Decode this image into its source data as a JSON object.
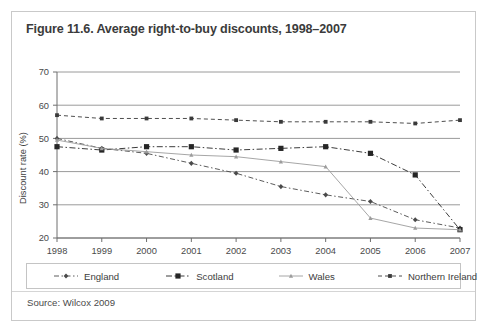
{
  "figure": {
    "title": "Figure 11.6. Average right-to-buy discounts, 1998–2007",
    "source": "Source: Wilcox 2009"
  },
  "colors": {
    "card_border": "#c9c9c9",
    "grid": "#9a9a9a",
    "axis": "#6f6f6f",
    "england": "#4a4a4a",
    "scotland": "#262626",
    "wales": "#9c9c9c",
    "northern_ireland": "#3a3a3a",
    "title_text": "#3b3b3b",
    "label_text": "#4a4a4a"
  },
  "legend": {
    "entries": [
      {
        "label": "England",
        "marker": "small-diamond",
        "color": "#4a4a4a"
      },
      {
        "label": "Scotland",
        "marker": "medium-square",
        "color": "#262626"
      },
      {
        "label": "Wales",
        "marker": "tiny-triangle",
        "color": "#9c9c9c"
      },
      {
        "label": "Northern Ireland",
        "marker": "square",
        "color": "#3a3a3a"
      }
    ]
  },
  "chart_data": {
    "type": "line",
    "title": "Figure 11.6. Average right-to-buy discounts, 1998–2007",
    "xlabel": "",
    "ylabel": "Discount rate (%)",
    "categories": [
      1998,
      1999,
      2000,
      2001,
      2002,
      2003,
      2004,
      2005,
      2006,
      2007
    ],
    "xtick_labels": [
      "1998",
      "1999",
      "2000",
      "2001",
      "2002",
      "2003",
      "2004",
      "2005",
      "2006",
      "2007"
    ],
    "ytick_labels": [
      "20",
      "30",
      "40",
      "50",
      "60",
      "70"
    ],
    "ylim": [
      20,
      70
    ],
    "ytick_step": 10,
    "grid": true,
    "legend_position": "bottom",
    "series": [
      {
        "name": "England",
        "color": "#4a4a4a",
        "values": [
          50.0,
          47.0,
          45.5,
          42.5,
          39.5,
          35.5,
          33.0,
          31.0,
          25.5,
          23.0
        ]
      },
      {
        "name": "Scotland",
        "color": "#262626",
        "values": [
          47.5,
          46.5,
          47.5,
          47.5,
          46.5,
          47.0,
          47.5,
          45.5,
          39.0,
          22.5
        ]
      },
      {
        "name": "Wales",
        "color": "#9c9c9c",
        "values": [
          49.5,
          47.0,
          46.0,
          45.0,
          44.5,
          43.0,
          41.5,
          26.0,
          23.0,
          22.5
        ]
      },
      {
        "name": "Northern Ireland",
        "color": "#3a3a3a",
        "values": [
          57.0,
          56.0,
          56.0,
          56.0,
          55.5,
          55.0,
          55.0,
          55.0,
          54.5,
          55.5
        ]
      }
    ]
  }
}
